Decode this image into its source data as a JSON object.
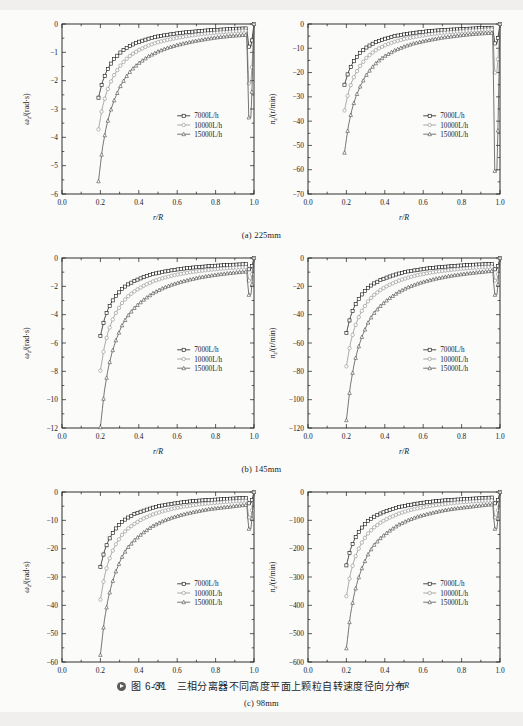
{
  "figure": {
    "caption_number": "图 6-31",
    "caption_text": "三相分离器不同高度平面上颗粒自转速度径向分布"
  },
  "panels": [
    {
      "id": "a",
      "caption": "(a) 225mm"
    },
    {
      "id": "b",
      "caption": "(b) 145mm"
    },
    {
      "id": "c",
      "caption": "(c) 98mm"
    }
  ],
  "legend_labels": [
    "7000L/h",
    "10000L/h",
    "15000L/h"
  ],
  "colors": {
    "series_7000": "#111111",
    "series_10000": "#8d8d8d",
    "series_15000": "#4a4a4a",
    "axis": "#1a1a1a",
    "page_bg": "#fbfbfa"
  },
  "chart_data": [
    {
      "type": "line",
      "title": "(a) 225mm",
      "xlabel": "r/R",
      "ylabel": "ω_z/(rad·s)",
      "xlim": [
        0.0,
        1.0
      ],
      "ylim": [
        -6,
        0
      ],
      "xticks": [
        "0.0",
        "0.2",
        "0.4",
        "0.6",
        "0.8",
        "1.0"
      ],
      "yticks": [
        "0",
        "-1",
        "-2",
        "-3",
        "-4",
        "-5",
        "-6"
      ],
      "grid": false,
      "legend_position": "center-right",
      "x": [
        0.19,
        0.21,
        0.23,
        0.25,
        0.27,
        0.3,
        0.33,
        0.36,
        0.4,
        0.45,
        0.5,
        0.55,
        0.6,
        0.65,
        0.7,
        0.75,
        0.8,
        0.85,
        0.9,
        0.94,
        0.965,
        0.97,
        0.985,
        1.0
      ],
      "series": [
        {
          "name": "7000L/h",
          "values": [
            -2.6,
            -2.05,
            -1.7,
            -1.45,
            -1.25,
            -1.03,
            -0.87,
            -0.75,
            -0.63,
            -0.52,
            -0.44,
            -0.38,
            -0.33,
            -0.29,
            -0.26,
            -0.23,
            -0.21,
            -0.19,
            -0.17,
            -0.16,
            -0.155,
            -0.8,
            -0.8,
            0.0
          ]
        },
        {
          "name": "10000L/h",
          "values": [
            -3.72,
            -2.95,
            -2.45,
            -2.1,
            -1.82,
            -1.5,
            -1.27,
            -1.09,
            -0.92,
            -0.76,
            -0.64,
            -0.56,
            -0.49,
            -0.43,
            -0.38,
            -0.34,
            -0.31,
            -0.28,
            -0.26,
            -0.24,
            -0.235,
            -2.1,
            -2.1,
            0.0
          ]
        },
        {
          "name": "15000L/h",
          "values": [
            -5.55,
            -4.4,
            -3.65,
            -3.12,
            -2.72,
            -2.24,
            -1.9,
            -1.63,
            -1.38,
            -1.14,
            -0.97,
            -0.84,
            -0.74,
            -0.66,
            -0.59,
            -0.53,
            -0.48,
            -0.44,
            -0.41,
            -0.39,
            -0.385,
            -3.3,
            -3.3,
            0.0
          ]
        }
      ]
    },
    {
      "type": "line",
      "title": "(a) 225mm",
      "xlabel": "r/R",
      "ylabel": "n_z/(r/min)",
      "xlim": [
        0.0,
        1.0
      ],
      "ylim": [
        -70,
        0
      ],
      "xticks": [
        "0.0",
        "0.2",
        "0.4",
        "0.6",
        "0.8",
        "1.0"
      ],
      "yticks": [
        "0",
        "-10",
        "-20",
        "-30",
        "-40",
        "-50",
        "-60",
        "-70"
      ],
      "grid": false,
      "legend_position": "center-right",
      "x": [
        0.19,
        0.21,
        0.23,
        0.25,
        0.27,
        0.3,
        0.33,
        0.36,
        0.4,
        0.45,
        0.5,
        0.55,
        0.6,
        0.65,
        0.7,
        0.75,
        0.8,
        0.85,
        0.9,
        0.94,
        0.965,
        0.97,
        0.985,
        1.0
      ],
      "series": [
        {
          "name": "7000L/h",
          "values": [
            -25.0,
            -19.8,
            -16.4,
            -14.0,
            -12.1,
            -9.9,
            -8.4,
            -7.2,
            -6.1,
            -5.0,
            -4.3,
            -3.7,
            -3.2,
            -2.8,
            -2.5,
            -2.3,
            -2.1,
            -1.9,
            -1.7,
            -1.6,
            -1.55,
            -8.0,
            -8.0,
            0.0
          ]
        },
        {
          "name": "10000L/h",
          "values": [
            -35.6,
            -28.2,
            -23.4,
            -20.1,
            -17.4,
            -14.3,
            -12.1,
            -10.4,
            -8.8,
            -7.3,
            -6.2,
            -5.4,
            -4.7,
            -4.1,
            -3.7,
            -3.3,
            -3.0,
            -2.7,
            -2.5,
            -2.3,
            -2.25,
            -20.0,
            -20.0,
            0.0
          ]
        },
        {
          "name": "15000L/h",
          "values": [
            -53.0,
            -42.0,
            -34.8,
            -29.8,
            -26.0,
            -21.4,
            -18.2,
            -15.6,
            -13.2,
            -10.9,
            -9.3,
            -8.0,
            -7.1,
            -6.3,
            -5.6,
            -5.1,
            -4.6,
            -4.2,
            -3.9,
            -3.7,
            -3.65,
            -60.5,
            -60.5,
            0.0
          ]
        }
      ]
    },
    {
      "type": "line",
      "title": "(b) 145mm",
      "xlabel": "r/R",
      "ylabel": "ω_z/(rad·s)",
      "xlim": [
        0.0,
        1.0
      ],
      "ylim": [
        -12,
        0
      ],
      "xticks": [
        "0.0",
        "0.2",
        "0.4",
        "0.6",
        "0.8",
        "1.0"
      ],
      "yticks": [
        "0",
        "-2",
        "-4",
        "-6",
        "-8",
        "-10",
        "-12"
      ],
      "grid": false,
      "legend_position": "center-right",
      "x": [
        0.2,
        0.22,
        0.24,
        0.26,
        0.28,
        0.31,
        0.34,
        0.38,
        0.42,
        0.47,
        0.52,
        0.57,
        0.62,
        0.67,
        0.72,
        0.77,
        0.82,
        0.87,
        0.92,
        0.95,
        0.965,
        0.97,
        0.985,
        1.0
      ],
      "series": [
        {
          "name": "7000L/h",
          "values": [
            -5.5,
            -4.35,
            -3.6,
            -3.08,
            -2.68,
            -2.22,
            -1.9,
            -1.6,
            -1.38,
            -1.15,
            -0.99,
            -0.87,
            -0.77,
            -0.69,
            -0.63,
            -0.57,
            -0.53,
            -0.49,
            -0.46,
            -0.44,
            -0.43,
            -0.8,
            -0.8,
            0.0
          ]
        },
        {
          "name": "10000L/h",
          "values": [
            -7.95,
            -6.3,
            -5.22,
            -4.47,
            -3.89,
            -3.22,
            -2.75,
            -2.32,
            -2.0,
            -1.67,
            -1.44,
            -1.26,
            -1.12,
            -1.0,
            -0.91,
            -0.83,
            -0.77,
            -0.71,
            -0.67,
            -0.64,
            -0.63,
            -1.6,
            -1.6,
            0.0
          ]
        },
        {
          "name": "15000L/h",
          "values": [
            -11.95,
            -9.45,
            -7.82,
            -6.7,
            -5.83,
            -4.82,
            -4.12,
            -3.48,
            -3.0,
            -2.51,
            -2.16,
            -1.89,
            -1.68,
            -1.51,
            -1.36,
            -1.25,
            -1.15,
            -1.07,
            -1.0,
            -0.96,
            -0.95,
            -2.6,
            -2.6,
            0.0
          ]
        }
      ]
    },
    {
      "type": "line",
      "title": "(b) 145mm",
      "xlabel": "r/R",
      "ylabel": "n_z/(r/min)",
      "xlim": [
        0.0,
        1.0
      ],
      "ylim": [
        -120,
        0
      ],
      "xticks": [
        "0.0",
        "0.2",
        "0.4",
        "0.6",
        "0.8",
        "1.0"
      ],
      "yticks": [
        "0",
        "-20",
        "-40",
        "-60",
        "-80",
        "-100",
        "-120"
      ],
      "grid": false,
      "legend_position": "center-right",
      "x": [
        0.2,
        0.22,
        0.24,
        0.26,
        0.28,
        0.31,
        0.34,
        0.38,
        0.42,
        0.47,
        0.52,
        0.57,
        0.62,
        0.67,
        0.72,
        0.77,
        0.82,
        0.87,
        0.92,
        0.95,
        0.965,
        0.97,
        0.985,
        1.0
      ],
      "series": [
        {
          "name": "7000L/h",
          "values": [
            -53.0,
            -41.9,
            -34.7,
            -29.7,
            -25.8,
            -21.4,
            -18.3,
            -15.4,
            -13.3,
            -11.1,
            -9.5,
            -8.4,
            -7.4,
            -6.7,
            -6.1,
            -5.5,
            -5.1,
            -4.7,
            -4.4,
            -4.2,
            -4.15,
            -8.0,
            -8.0,
            0.0
          ]
        },
        {
          "name": "10000L/h",
          "values": [
            -76.5,
            -60.6,
            -50.2,
            -43.0,
            -37.4,
            -31.0,
            -26.5,
            -22.3,
            -19.2,
            -16.1,
            -13.9,
            -12.1,
            -10.8,
            -9.6,
            -8.8,
            -8.0,
            -7.4,
            -6.8,
            -6.4,
            -6.2,
            -6.1,
            -16.0,
            -16.0,
            0.0
          ]
        },
        {
          "name": "15000L/h",
          "values": [
            -114.5,
            -90.6,
            -75.0,
            -64.2,
            -55.9,
            -46.2,
            -39.5,
            -33.4,
            -28.8,
            -24.1,
            -20.7,
            -18.1,
            -16.1,
            -14.5,
            -13.1,
            -12.0,
            -11.1,
            -10.3,
            -9.6,
            -9.2,
            -9.1,
            -26.0,
            -26.0,
            0.0
          ]
        }
      ]
    },
    {
      "type": "line",
      "title": "(c) 98mm",
      "xlabel": "r/R",
      "ylabel": "ω_z/(rad·s)",
      "xlim": [
        0.0,
        1.0
      ],
      "ylim": [
        -60,
        0
      ],
      "xticks": [
        "0.0",
        "0.2",
        "0.4",
        "0.6",
        "0.8",
        "1.0"
      ],
      "yticks": [
        "0",
        "-10",
        "-20",
        "-30",
        "-40",
        "-50",
        "-60"
      ],
      "grid": false,
      "legend_position": "center-right",
      "x": [
        0.2,
        0.22,
        0.24,
        0.26,
        0.28,
        0.31,
        0.34,
        0.38,
        0.42,
        0.47,
        0.52,
        0.57,
        0.62,
        0.67,
        0.72,
        0.77,
        0.82,
        0.87,
        0.92,
        0.95,
        0.965,
        0.97,
        0.985,
        1.0
      ],
      "series": [
        {
          "name": "7000L/h",
          "values": [
            -26.5,
            -21.0,
            -17.4,
            -14.9,
            -12.9,
            -10.7,
            -9.2,
            -7.7,
            -6.7,
            -5.6,
            -4.8,
            -4.2,
            -3.7,
            -3.3,
            -3.0,
            -2.8,
            -2.6,
            -2.4,
            -2.2,
            -2.1,
            -2.05,
            -4.0,
            -4.0,
            0.0
          ]
        },
        {
          "name": "10000L/h",
          "values": [
            -38.0,
            -30.1,
            -24.9,
            -21.3,
            -18.5,
            -15.3,
            -13.1,
            -11.1,
            -9.5,
            -8.0,
            -6.9,
            -6.0,
            -5.3,
            -4.8,
            -4.3,
            -4.0,
            -3.7,
            -3.4,
            -3.2,
            -3.1,
            -3.05,
            -9.0,
            -9.0,
            0.0
          ]
        },
        {
          "name": "15000L/h",
          "values": [
            -57.5,
            -45.5,
            -37.7,
            -32.3,
            -28.1,
            -23.2,
            -19.8,
            -16.8,
            -14.5,
            -12.1,
            -10.4,
            -9.1,
            -8.1,
            -7.3,
            -6.6,
            -6.0,
            -5.6,
            -5.2,
            -4.8,
            -4.6,
            -4.55,
            -13.0,
            -13.0,
            0.0
          ]
        }
      ]
    },
    {
      "type": "line",
      "title": "(c) 98mm",
      "xlabel": "r/R",
      "ylabel": "n_z/(r/min)",
      "xlim": [
        0.0,
        1.0
      ],
      "ylim": [
        -600,
        0
      ],
      "xticks": [
        "0.0",
        "0.2",
        "0.4",
        "0.6",
        "0.8",
        "1.0"
      ],
      "yticks": [
        "0",
        "-100",
        "-200",
        "-300",
        "-400",
        "-500",
        "-600"
      ],
      "grid": false,
      "legend_position": "center-right",
      "x": [
        0.2,
        0.22,
        0.24,
        0.26,
        0.28,
        0.31,
        0.34,
        0.38,
        0.42,
        0.47,
        0.52,
        0.57,
        0.62,
        0.67,
        0.72,
        0.77,
        0.82,
        0.87,
        0.92,
        0.95,
        0.965,
        0.97,
        0.985,
        1.0
      ],
      "series": [
        {
          "name": "7000L/h",
          "values": [
            -259.0,
            -205.0,
            -170.0,
            -145.0,
            -126.0,
            -104.0,
            -89.0,
            -75.0,
            -65.0,
            -54.0,
            -47.0,
            -41.0,
            -36.0,
            -32.0,
            -29.0,
            -27.0,
            -25.0,
            -23.0,
            -21.0,
            -20.0,
            -19.5,
            -40.0,
            -40.0,
            0.0
          ]
        },
        {
          "name": "10000L/h",
          "values": [
            -368.0,
            -291.0,
            -241.0,
            -206.0,
            -179.0,
            -148.0,
            -127.0,
            -107.0,
            -92.0,
            -77.0,
            -66.0,
            -58.0,
            -51.0,
            -46.0,
            -42.0,
            -38.0,
            -35.0,
            -33.0,
            -31.0,
            -30.0,
            -29.5,
            -90.0,
            -90.0,
            0.0
          ]
        },
        {
          "name": "15000L/h",
          "values": [
            -552.0,
            -437.0,
            -362.0,
            -310.0,
            -270.0,
            -223.0,
            -190.0,
            -161.0,
            -139.0,
            -116.0,
            -100.0,
            -87.0,
            -78.0,
            -70.0,
            -63.0,
            -58.0,
            -54.0,
            -50.0,
            -46.0,
            -44.0,
            -43.5,
            -130.0,
            -130.0,
            0.0
          ]
        }
      ]
    }
  ]
}
